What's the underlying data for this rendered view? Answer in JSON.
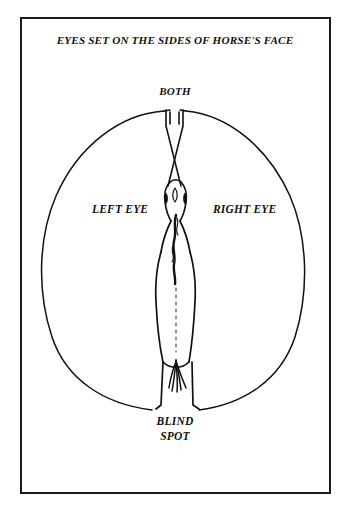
{
  "figure": {
    "title": "EYES SET ON THE SIDES OF HORSE'S FACE",
    "labels": {
      "both": "BOTH",
      "left_eye": "LEFT EYE",
      "right_eye": "RIGHT EYE",
      "blind_spot_line1": "BLIND",
      "blind_spot_line2": "SPOT"
    },
    "colors": {
      "ink": "#111111",
      "frame": "#1a1a1a",
      "background": "#ffffff"
    },
    "diagram": {
      "subject": "horse-vision-field-top-view",
      "vision_oval": {
        "center_x": 176,
        "center_y": 259,
        "radius_x": 136,
        "radius_y": 152
      },
      "binocular_cone_apex_y": 186,
      "blind_spot_open_y": 410
    }
  }
}
